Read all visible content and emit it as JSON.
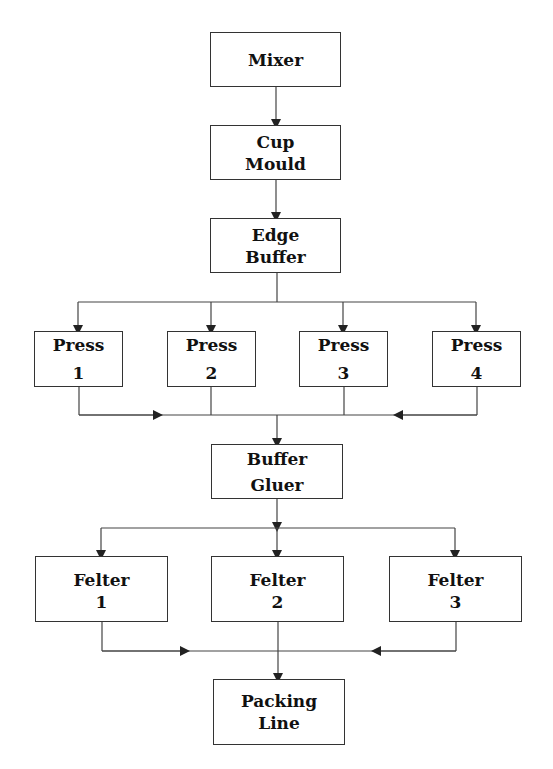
{
  "nodes": {
    "mixer": {
      "line1": "Mixer",
      "line2": ""
    },
    "cup_mould": {
      "line1": "Cup",
      "line2": "Mould"
    },
    "edge_buffer": {
      "line1": "Edge",
      "line2": "Buffer"
    },
    "press1": {
      "line1": "Press",
      "line2": "1"
    },
    "press2": {
      "line1": "Press",
      "line2": "2"
    },
    "press3": {
      "line1": "Press",
      "line2": "3"
    },
    "press4": {
      "line1": "Press",
      "line2": "4"
    },
    "buffer_gluer": {
      "line1": "Buffer",
      "line2": "Gluer"
    },
    "felter1": {
      "line1": "Felter",
      "line2": "1"
    },
    "felter2": {
      "line1": "Felter",
      "line2": "2"
    },
    "felter3": {
      "line1": "Felter",
      "line2": "3"
    },
    "packing_line": {
      "line1": "Packing",
      "line2": "Line"
    }
  },
  "edges": [
    [
      "Mixer",
      "Cup Mould"
    ],
    [
      "Cup Mould",
      "Edge Buffer"
    ],
    [
      "Edge Buffer",
      "Press 1"
    ],
    [
      "Edge Buffer",
      "Press 2"
    ],
    [
      "Edge Buffer",
      "Press 3"
    ],
    [
      "Edge Buffer",
      "Press 4"
    ],
    [
      "Press 1",
      "Buffer Gluer"
    ],
    [
      "Press 2",
      "Buffer Gluer"
    ],
    [
      "Press 3",
      "Buffer Gluer"
    ],
    [
      "Press 4",
      "Buffer Gluer"
    ],
    [
      "Buffer Gluer",
      "Felter 1"
    ],
    [
      "Buffer Gluer",
      "Felter 2"
    ],
    [
      "Buffer Gluer",
      "Felter 3"
    ],
    [
      "Felter 1",
      "Packing Line"
    ],
    [
      "Felter 2",
      "Packing Line"
    ],
    [
      "Felter 3",
      "Packing Line"
    ]
  ]
}
